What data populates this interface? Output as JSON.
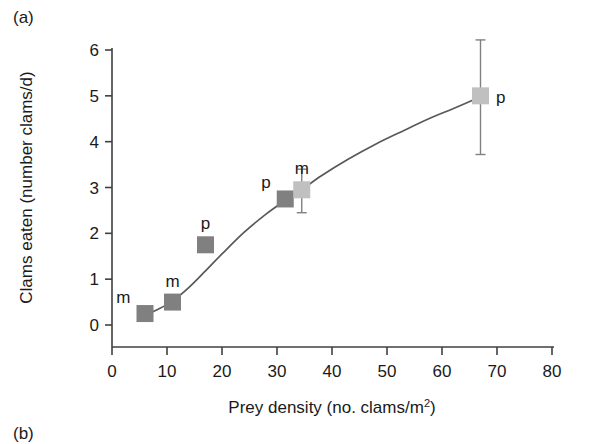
{
  "figure": {
    "panel_a_letter": "(a)",
    "panel_b_letter": "(b)"
  },
  "chart_data": {
    "type": "scatter",
    "title": "",
    "xlabel_parts": {
      "main": "Prey density (no. clams/m",
      "superscript": "2",
      "tail": ")"
    },
    "xlabel": "Prey density (no. clams/m2)",
    "ylabel": "Clams eaten (number clams/d)",
    "xlim": [
      0,
      80
    ],
    "ylim": [
      0,
      6
    ],
    "xticks": [
      0,
      10,
      20,
      30,
      40,
      50,
      60,
      70,
      80
    ],
    "xticklabels": [
      "0",
      "10",
      "20",
      "30",
      "40",
      "50",
      "60",
      "70",
      "80"
    ],
    "yticks": [
      0,
      1,
      2,
      3,
      4,
      5,
      6
    ],
    "yticklabels": [
      "0",
      "1",
      "2",
      "3",
      "4",
      "5",
      "6"
    ],
    "grid": false,
    "legend": "none",
    "marker_shape": "square",
    "colors": {
      "marker_dark": "#808080",
      "marker_light": "#c0c0c0",
      "curve": "#595959",
      "axis": "#404040",
      "errorbar": "#808080",
      "text": "#1a1a1a"
    },
    "points": [
      {
        "label": "m",
        "x": 6.0,
        "y": 0.25,
        "tone": "dark",
        "label_pos": "above-left",
        "err_low": null,
        "err_high": null
      },
      {
        "label": "m",
        "x": 11.0,
        "y": 0.5,
        "tone": "dark",
        "label_pos": "above",
        "err_low": null,
        "err_high": null
      },
      {
        "label": "p",
        "x": 17.0,
        "y": 1.75,
        "tone": "dark",
        "label_pos": "above",
        "err_low": null,
        "err_high": null
      },
      {
        "label": "p",
        "x": 31.5,
        "y": 2.75,
        "tone": "dark",
        "label_pos": "above-left",
        "err_low": null,
        "err_high": null
      },
      {
        "label": "m",
        "x": 34.5,
        "y": 2.95,
        "tone": "light",
        "label_pos": "above",
        "err_low": 2.45,
        "err_high": 3.4
      },
      {
        "label": "p",
        "x": 67.0,
        "y": 5.0,
        "tone": "light",
        "label_pos": "right",
        "err_low": 3.72,
        "err_high": 6.22
      }
    ],
    "fit_curve": {
      "description": "sigmoid functional response fit",
      "x": [
        5.5,
        8,
        11,
        14,
        17,
        20,
        24,
        28,
        31.5,
        34.5,
        38,
        43,
        48,
        53,
        58,
        62,
        67
      ],
      "y": [
        0.18,
        0.32,
        0.52,
        0.82,
        1.18,
        1.55,
        2.02,
        2.42,
        2.72,
        2.95,
        3.25,
        3.62,
        3.95,
        4.24,
        4.52,
        4.72,
        4.98
      ]
    }
  }
}
